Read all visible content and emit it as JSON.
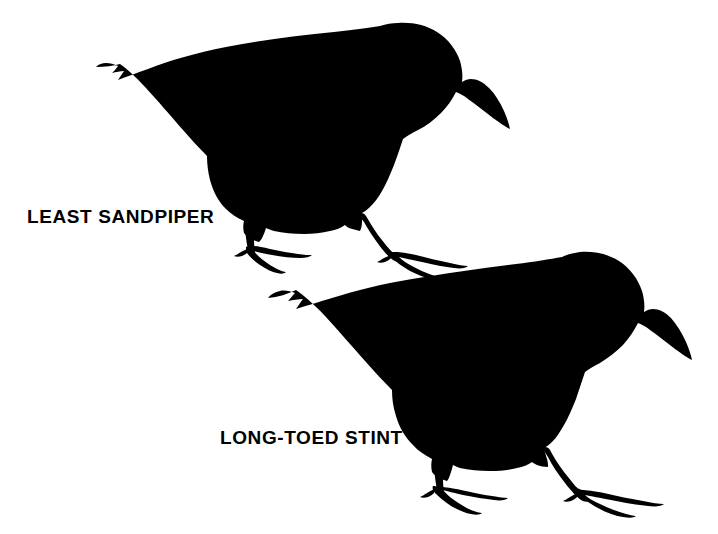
{
  "plate": {
    "background_color": "#ffffff",
    "ink_color": "#000000",
    "width": 718,
    "height": 534
  },
  "figures": [
    {
      "id": "least-sandpiper",
      "label": "LEAST SANDPIPER",
      "label_position": {
        "x": 27,
        "y": 207
      },
      "silhouette": "standing shorebird facing right, short slightly drooped bill, rounded head, long pointed tail to upper left, two legs with splayed toes",
      "bounds": {
        "x": 96,
        "y": 22,
        "width": 414,
        "height": 250
      }
    },
    {
      "id": "long-toed-stint",
      "label": "LONG-TOED STINT",
      "label_position": {
        "x": 220,
        "y": 428
      },
      "silhouette": "standing shorebird facing right, short slightly drooped bill, rounded head, long pointed tail to upper left, two legs with long splayed toes",
      "bounds": {
        "x": 268,
        "y": 251,
        "width": 430,
        "height": 258
      }
    }
  ]
}
